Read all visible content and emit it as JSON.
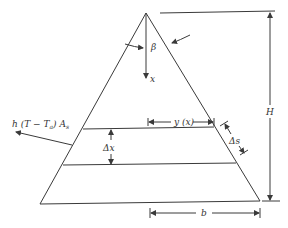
{
  "figure": {
    "labels": {
      "beta": "β",
      "x": "x",
      "y": "y (x)",
      "H": "H",
      "b": "b",
      "dx": "Δx",
      "ds": "Δs",
      "heat_loss": "h (T − T",
      "heat_loss_sub": "a",
      "heat_loss_tail": ") A",
      "heat_loss_sub2": "s"
    }
  }
}
